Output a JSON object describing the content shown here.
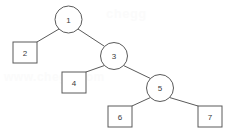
{
  "figure": {
    "background_color": "#ffffff",
    "stroke_color": "#5a5a5a",
    "label_color": "#3a3a3a"
  },
  "watermarks": {
    "top": "chegg",
    "bottom": "www.chegg.com"
  },
  "chart_data": {
    "type": "diagram",
    "diagram_kind": "binary-tree",
    "title": "",
    "nodes": [
      {
        "id": "n1",
        "label": "1",
        "shape": "circle",
        "cx": 68.5,
        "cy": 19.5,
        "r": 13.5
      },
      {
        "id": "n2",
        "label": "2",
        "shape": "square",
        "x": 13,
        "y": 42,
        "w": 24,
        "h": 21
      },
      {
        "id": "n3",
        "label": "3",
        "shape": "circle",
        "cx": 114,
        "cy": 56,
        "r": 13.5
      },
      {
        "id": "n4",
        "label": "4",
        "shape": "square",
        "x": 62,
        "y": 72,
        "w": 24,
        "h": 21
      },
      {
        "id": "n5",
        "label": "5",
        "shape": "circle",
        "cx": 160,
        "cy": 88,
        "r": 13.5
      },
      {
        "id": "n6",
        "label": "6",
        "shape": "square",
        "x": 108,
        "y": 106,
        "w": 24,
        "h": 21
      },
      {
        "id": "n7",
        "label": "7",
        "shape": "square",
        "x": 198,
        "y": 106,
        "w": 24,
        "h": 21
      }
    ],
    "edges": [
      {
        "from": "n1",
        "to": "n2",
        "x1": 59,
        "y1": 29,
        "x2": 37,
        "y2": 42
      },
      {
        "from": "n1",
        "to": "n3",
        "x1": 78,
        "y1": 29,
        "x2": 104,
        "y2": 46
      },
      {
        "from": "n3",
        "to": "n4",
        "x1": 104.5,
        "y1": 65.5,
        "x2": 86,
        "y2": 72
      },
      {
        "from": "n3",
        "to": "n5",
        "x1": 123.5,
        "y1": 65.5,
        "x2": 150.5,
        "y2": 78.5
      },
      {
        "from": "n5",
        "to": "n6",
        "x1": 150.5,
        "y1": 97.5,
        "x2": 132,
        "y2": 106
      },
      {
        "from": "n5",
        "to": "n7",
        "x1": 169.5,
        "y1": 97.5,
        "x2": 198,
        "y2": 106
      }
    ]
  }
}
